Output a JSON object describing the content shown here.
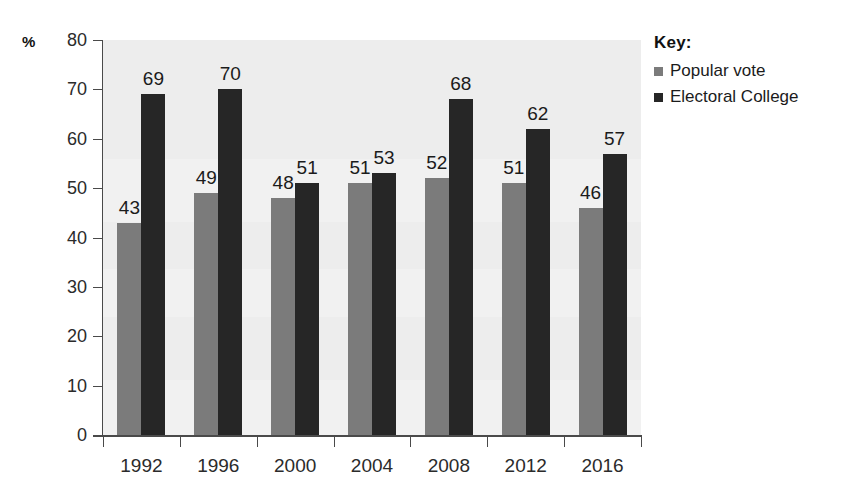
{
  "chart_data": {
    "type": "bar",
    "title": "",
    "xlabel": "",
    "ylabel": "%",
    "ylim": [
      0,
      80
    ],
    "yticks": [
      0,
      10,
      20,
      30,
      40,
      50,
      60,
      70,
      80
    ],
    "grid": false,
    "legend_position": "right",
    "categories": [
      "1992",
      "1996",
      "2000",
      "2004",
      "2008",
      "2012",
      "2016"
    ],
    "series": [
      {
        "name": "Popular vote",
        "color": "#7b7b7b",
        "values": [
          43,
          49,
          48,
          51,
          52,
          51,
          46
        ]
      },
      {
        "name": "Electoral College",
        "color": "#262626",
        "values": [
          69,
          70,
          51,
          53,
          68,
          62,
          57
        ]
      }
    ]
  },
  "axis": {
    "y_unit_label": "%",
    "y_tick_labels": [
      "80",
      "70",
      "60",
      "50",
      "40",
      "30",
      "20",
      "10",
      "0"
    ],
    "x_tick_labels": [
      "1992",
      "1996",
      "2000",
      "2004",
      "2008",
      "2012",
      "2016"
    ]
  },
  "legend": {
    "title": "Key:",
    "entries": [
      {
        "label": "Popular vote",
        "color": "#7b7b7b",
        "swatch": "square-gray-icon"
      },
      {
        "label": "Electoral College",
        "color": "#262626",
        "swatch": "square-black-icon"
      }
    ]
  }
}
